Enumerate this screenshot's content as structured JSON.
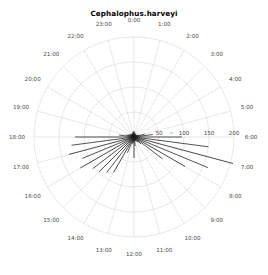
{
  "chart_data": {
    "type": "line",
    "subtype": "polar-ray-clock",
    "title": "Cephalophus.harveyi",
    "xlabel": "",
    "ylabel": "",
    "grid": true,
    "legend": null,
    "angular_axis": {
      "unit": "hour",
      "direction": "clockwise",
      "zero_at": "top",
      "tick_labels": [
        "0:00",
        "1:00",
        "2:00",
        "3:00",
        "4:00",
        "5:00",
        "6:00",
        "7:00",
        "8:00",
        "9:00",
        "10:00",
        "11:00",
        "12:00",
        "13:00",
        "14:00",
        "15:00",
        "16:00",
        "17:00",
        "18:00",
        "19:00",
        "20:00",
        "21:00",
        "22:00",
        "23:00"
      ]
    },
    "radial_axis": {
      "tick_labels": [
        "50",
        "100",
        "150",
        "200"
      ],
      "tick_values": [
        50,
        100,
        150,
        200
      ],
      "rlim": [
        0,
        200
      ],
      "ring_count": 4
    },
    "categories": [
      "0:00",
      "1:00",
      "2:00",
      "3:00",
      "4:00",
      "5:00",
      "6:00",
      "7:00",
      "8:00",
      "9:00",
      "10:00",
      "11:00",
      "12:00",
      "13:00",
      "14:00",
      "15:00",
      "16:00",
      "17:00",
      "18:00",
      "19:00",
      "20:00",
      "21:00",
      "22:00",
      "23:00"
    ],
    "values": [
      12,
      8,
      6,
      5,
      7,
      22,
      96,
      205,
      118,
      20,
      10,
      8,
      42,
      14,
      82,
      98,
      124,
      135,
      118,
      16,
      10,
      9,
      7,
      10
    ],
    "rays": [
      {
        "angle_deg": 0,
        "value": 12,
        "label": "0:00"
      },
      {
        "angle_deg": 7.5,
        "value": 9,
        "label": ""
      },
      {
        "angle_deg": 15,
        "value": 8,
        "label": "1:00"
      },
      {
        "angle_deg": 22.5,
        "value": 7,
        "label": ""
      },
      {
        "angle_deg": 30,
        "value": 6,
        "label": "2:00"
      },
      {
        "angle_deg": 37.5,
        "value": 6,
        "label": ""
      },
      {
        "angle_deg": 45,
        "value": 5,
        "label": "3:00"
      },
      {
        "angle_deg": 52.5,
        "value": 6,
        "label": ""
      },
      {
        "angle_deg": 60,
        "value": 7,
        "label": "4:00"
      },
      {
        "angle_deg": 67.5,
        "value": 11,
        "label": ""
      },
      {
        "angle_deg": 75,
        "value": 22,
        "label": "5:00"
      },
      {
        "angle_deg": 82.5,
        "value": 38,
        "label": ""
      },
      {
        "angle_deg": 90,
        "value": 96,
        "label": "6:00"
      },
      {
        "angle_deg": 97.5,
        "value": 150,
        "label": ""
      },
      {
        "angle_deg": 105,
        "value": 205,
        "label": "7:00"
      },
      {
        "angle_deg": 112.5,
        "value": 160,
        "label": ""
      },
      {
        "angle_deg": 120,
        "value": 118,
        "label": "8:00"
      },
      {
        "angle_deg": 127.5,
        "value": 72,
        "label": ""
      },
      {
        "angle_deg": 135,
        "value": 20,
        "label": "9:00"
      },
      {
        "angle_deg": 142.5,
        "value": 14,
        "label": ""
      },
      {
        "angle_deg": 150,
        "value": 10,
        "label": "10:00"
      },
      {
        "angle_deg": 157.5,
        "value": 9,
        "label": ""
      },
      {
        "angle_deg": 165,
        "value": 8,
        "label": "11:00"
      },
      {
        "angle_deg": 172.5,
        "value": 18,
        "label": ""
      },
      {
        "angle_deg": 180,
        "value": 42,
        "label": "12:00"
      },
      {
        "angle_deg": 187.5,
        "value": 12,
        "label": ""
      },
      {
        "angle_deg": 195,
        "value": 14,
        "label": "13:00"
      },
      {
        "angle_deg": 202.5,
        "value": 34,
        "label": ""
      },
      {
        "angle_deg": 210,
        "value": 82,
        "label": "14:00"
      },
      {
        "angle_deg": 217.5,
        "value": 90,
        "label": ""
      },
      {
        "angle_deg": 225,
        "value": 98,
        "label": "15:00"
      },
      {
        "angle_deg": 232.5,
        "value": 104,
        "label": ""
      },
      {
        "angle_deg": 240,
        "value": 124,
        "label": "16:00"
      },
      {
        "angle_deg": 247.5,
        "value": 112,
        "label": ""
      },
      {
        "angle_deg": 255,
        "value": 135,
        "label": "17:00"
      },
      {
        "angle_deg": 262.5,
        "value": 126,
        "label": ""
      },
      {
        "angle_deg": 270,
        "value": 118,
        "label": "18:00"
      },
      {
        "angle_deg": 277.5,
        "value": 30,
        "label": ""
      },
      {
        "angle_deg": 285,
        "value": 16,
        "label": "19:00"
      },
      {
        "angle_deg": 292.5,
        "value": 12,
        "label": ""
      },
      {
        "angle_deg": 300,
        "value": 10,
        "label": "20:00"
      },
      {
        "angle_deg": 307.5,
        "value": 9,
        "label": ""
      },
      {
        "angle_deg": 315,
        "value": 9,
        "label": "21:00"
      },
      {
        "angle_deg": 322.5,
        "value": 8,
        "label": ""
      },
      {
        "angle_deg": 330,
        "value": 7,
        "label": "22:00"
      },
      {
        "angle_deg": 337.5,
        "value": 8,
        "label": ""
      },
      {
        "angle_deg": 345,
        "value": 10,
        "label": "23:00"
      },
      {
        "angle_deg": 352.5,
        "value": 11,
        "label": ""
      }
    ],
    "colors": {
      "ray": "#1a1a1a",
      "grid": "#d8d8d8",
      "text": "#4a4a4a",
      "title": "#000000",
      "background": "#ffffff"
    }
  }
}
